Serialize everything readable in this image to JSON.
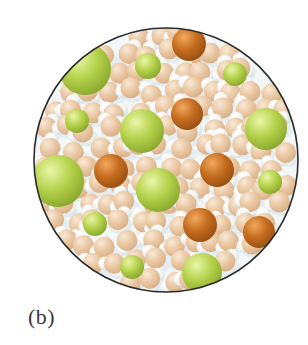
{
  "figure": {
    "label": "(b)",
    "type": "molecular-view",
    "circle": {
      "cx": 166,
      "cy": 160,
      "r": 132,
      "border_color": "#2b2b2b",
      "border_width": 1.6,
      "background": "#f3f7f7"
    },
    "colors": {
      "green_ion": {
        "highlight": "#eaf6a8",
        "mid": "#b5d24b",
        "edge": "#7c9a25"
      },
      "orange_ion": {
        "highlight": "#f2a95e",
        "mid": "#c56c1f",
        "edge": "#8a470f"
      },
      "water_oxygen": {
        "highlight": "#f9e9d6",
        "mid": "#eac8a4",
        "edge": "#d3a67b"
      },
      "water_hydrogen": {
        "highlight": "#ffffff",
        "mid": "#f4f6f4",
        "edge": "#c7dae1"
      },
      "water_shadow": "#d9e6eb",
      "page_background": "#ffffff",
      "label_color": "#3a3a3a"
    },
    "green_ions": [
      {
        "x": 85,
        "y": 69,
        "r": 26
      },
      {
        "x": 148,
        "y": 66,
        "r": 13
      },
      {
        "x": 235,
        "y": 74,
        "r": 12
      },
      {
        "x": 77,
        "y": 121,
        "r": 12
      },
      {
        "x": 142,
        "y": 131,
        "r": 22
      },
      {
        "x": 266,
        "y": 129,
        "r": 21
      },
      {
        "x": 58,
        "y": 181,
        "r": 26
      },
      {
        "x": 158,
        "y": 190,
        "r": 22
      },
      {
        "x": 270,
        "y": 182,
        "r": 12
      },
      {
        "x": 95,
        "y": 224,
        "r": 12
      },
      {
        "x": 132,
        "y": 267,
        "r": 12
      },
      {
        "x": 202,
        "y": 273,
        "r": 20
      }
    ],
    "orange_ions": [
      {
        "x": 189,
        "y": 44,
        "r": 17
      },
      {
        "x": 187,
        "y": 114,
        "r": 16
      },
      {
        "x": 111,
        "y": 171,
        "r": 17
      },
      {
        "x": 217,
        "y": 170,
        "r": 17
      },
      {
        "x": 200,
        "y": 225,
        "r": 17
      },
      {
        "x": 259,
        "y": 232,
        "r": 16
      }
    ],
    "water": {
      "seed": 11,
      "oxygen_radius": 10.5,
      "hydrogen_radius": 7,
      "grid_step_x": 21,
      "grid_step_y": 19
    }
  }
}
